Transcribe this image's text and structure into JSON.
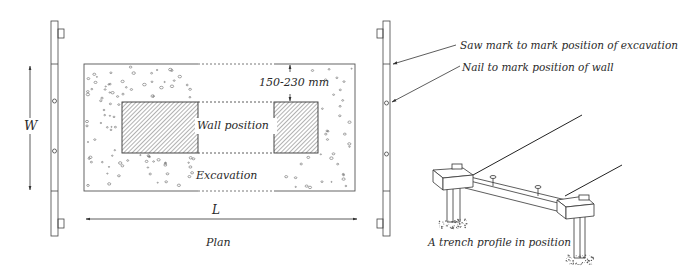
{
  "diagram": {
    "type": "technical-drawing",
    "colors": {
      "ink": "#3a3a3a",
      "paper": "#ffffff",
      "hatch": "#555555",
      "speckle": "#6a6a6a"
    }
  },
  "plan": {
    "caption": "Plan",
    "dimension_length": "L",
    "dimension_width": "W",
    "offset_dimension": "150-230 mm",
    "wall_label": "Wall position",
    "excavation_label": "Excavation"
  },
  "profile_board": {
    "callouts": [
      {
        "id": "saw-mark",
        "text": "Saw mark to mark position of excavation"
      },
      {
        "id": "nail",
        "text": "Nail to mark position of wall"
      }
    ]
  },
  "perspective": {
    "caption": "A trench profile in position"
  }
}
